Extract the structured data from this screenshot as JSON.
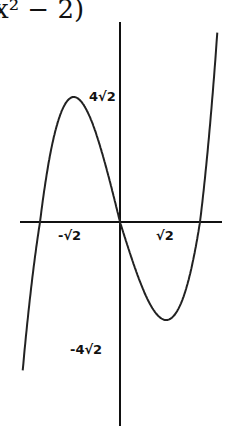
{
  "title_fragment": "x² − 2)",
  "chart_data": {
    "type": "line",
    "xlabel": "",
    "ylabel": "",
    "function": "x^3 - 2x",
    "x_tick_labels": [
      "-√2",
      "√2"
    ],
    "y_tick_labels": [
      "4√2",
      "-4√2"
    ],
    "points": [
      {
        "x": -2.1,
        "y": -5.06
      },
      {
        "x": -1.414,
        "y": 0
      },
      {
        "x": -0.816,
        "y": 1.09
      },
      {
        "x": 0,
        "y": 0
      },
      {
        "x": 0.816,
        "y": -1.09
      },
      {
        "x": 1.414,
        "y": 0
      },
      {
        "x": 2.1,
        "y": 5.06
      }
    ],
    "annotations": [
      {
        "label": "4√2",
        "at": "local maximum"
      },
      {
        "label": "-4√2",
        "at": "local minimum"
      }
    ],
    "grid": false
  },
  "labels": {
    "max": "4√2",
    "min": "-4√2",
    "neg_root": "-√2",
    "pos_root": "√2"
  }
}
